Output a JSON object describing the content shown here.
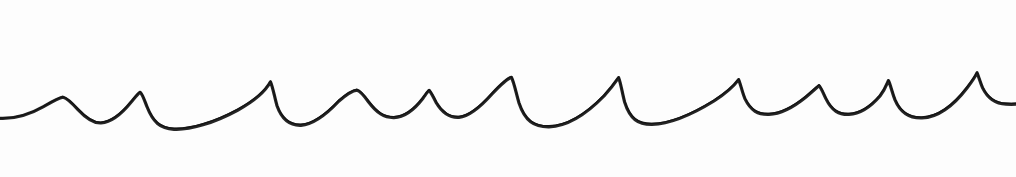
{
  "artwork": {
    "title": "Hand-drawn scalloped wave line",
    "description": "A single continuous black ink line forming a row of wave-like scallops (cusps) across a white field, drawn freehand with varying stroke weight.",
    "medium": "ink line drawing",
    "orientation": "horizontal band",
    "canvas": {
      "width": 1016,
      "height": 177,
      "background_color": "#fdfdfd"
    },
    "stroke": {
      "color": "#141414",
      "min_width": 1.4,
      "max_width": 3.2,
      "linecap": "round",
      "linejoin": "round"
    },
    "baseline_y": 110,
    "peak_count": 11,
    "trough_count": 12,
    "peaks": [
      {
        "index": 1,
        "x": 63,
        "y": 97
      },
      {
        "index": 2,
        "x": 140,
        "y": 92
      },
      {
        "index": 3,
        "x": 271,
        "y": 80
      },
      {
        "index": 4,
        "x": 357,
        "y": 90
      },
      {
        "index": 5,
        "x": 429,
        "y": 89
      },
      {
        "index": 6,
        "x": 512,
        "y": 77
      },
      {
        "index": 7,
        "x": 619,
        "y": 77
      },
      {
        "index": 8,
        "x": 739,
        "y": 79
      },
      {
        "index": 9,
        "x": 819,
        "y": 85
      },
      {
        "index": 10,
        "x": 888,
        "y": 80
      },
      {
        "index": 11,
        "x": 977,
        "y": 72
      }
    ],
    "troughs": [
      {
        "index": 1,
        "x": 10,
        "y": 119
      },
      {
        "index": 2,
        "x": 101,
        "y": 112
      },
      {
        "index": 3,
        "x": 181,
        "y": 127
      },
      {
        "index": 4,
        "x": 311,
        "y": 120
      },
      {
        "index": 5,
        "x": 395,
        "y": 112
      },
      {
        "index": 6,
        "x": 470,
        "y": 110
      },
      {
        "index": 7,
        "x": 563,
        "y": 113
      },
      {
        "index": 8,
        "x": 674,
        "y": 113
      },
      {
        "index": 9,
        "x": 781,
        "y": 103
      },
      {
        "index": 10,
        "x": 856,
        "y": 105
      },
      {
        "index": 11,
        "x": 931,
        "y": 105
      },
      {
        "index": 12,
        "x": 1014,
        "y": 103
      }
    ],
    "path_d": "M 0 118 C 14 118.6 30 114 44 106 C 53 100.8 58.5 97.6 63 96.8 C 67.5 97.8 72 102.5 78 109 C 87 118.5 94 122.6 101 122.2 C 110 121.4 121 113.8 131 101.5 C 136 95.6 138.6 92.3 140.2 91.6 C 142.2 92.8 144 98.2 147 106 C 153 121 160 127.4 174 128.2 C 190 129 214 122 238 109 C 256 99 266 89.4 270.5 81 C 272.8 86 274.4 95.8 277 105 C 282 119 290 124.6 301 124.2 C 312 123.6 325 114.8 339 100 C 348 92.4 353.6 89.6 357 89.4 C 360.4 90.2 364 94.6 368.6 101 C 377 112 384 116.8 394 116.6 C 404 116.2 414 109 423 97.4 C 426.5 92.6 428 90.2 429.2 89.6 C 431 91 433 95.8 436.4 102 C 443 113 450 117 459 116.4 C 468 115.6 479 107.6 492 93 C 502 82.4 508 77.4 511.5 76.6 C 514 81.4 516 91.6 519 102 C 525 120 534 126 549 125.8 C 566 125.4 584 115.6 604 95 C 612 86 616.6 79.6 618.6 76.8 C 620.6 81.4 622 91 624.6 101 C 630 118 638 123.6 652 123.4 C 670 123 692 113.6 714 100 C 727 91.6 734 85 738.6 78.8 C 740.6 83.2 742 90.8 745 98 C 751 110 758 113.8 769 113.4 C 780 113 793 106.6 806 96 C 813.4 89.8 817 86.4 819 84.8 C 821 86.6 823 91.8 826 98 C 832 110 839 113.8 849 113.4 C 859 113 870 106.6 880 95 C 885 88.6 887 83 888.4 79.8 C 890.4 83.4 892 91.4 895 99 C 901 113 910 117.4 922 117 C 936 116.4 952 106.6 967 87 C 973 79 976 74.2 977 72 C 978.6 75.4 980 81 982.6 87 C 988 98 995 102.8 1006 103.2 C 1010 103.4 1013 103.4 1016 103.2",
    "path_d_weight": "M 0 118.4 C 14 119 30 114.4 44 106.4 C 53 101.2 58.5 98 63 97.2 C 67.5 98.2 72 103 78 109.6 C 87 119.2 94 123.4 101 123 C 110 122.2 121 114.6 131 102.2 C 136 96.3 138.6 93 140.2 92.3 C 142.2 93.5 144 99 147 106.8 C 153 122 160 128.5 174 129.3 C 190 130.1 214 123 238 110 C 256 100 266 90.2 270.5 81.8 C 272.8 86.8 274.4 96.6 277 105.8 C 282 120 290 125.7 301 125.3 C 312 124.7 325 115.9 339 101 C 348 93.3 353.6 90.5 357 90.2 C 360.4 91 364 95.5 368.6 102 C 377 113 384 117.8 394 117.6 C 404 117.2 414 110 423 98.2 C 426.5 93.4 428 91 429.2 90.4 C 431 91.8 433 96.6 436.4 103 C 443 114 450 118 459 117.4 C 468 116.6 479 108.6 492 94 C 502 83.3 508 78.3 511.5 77.4 C 514 82.2 516 92.5 519 103 C 525 121 534 127 549 126.8 C 566 126.4 584 116.6 604 96 C 612 87 616.6 80.5 618.6 77.6 C 620.6 82.2 622 91.9 624.6 102 C 630 119 638 124.6 652 124.4 C 670 124 692 114.6 714 101 C 727 92.5 734 85.9 738.6 79.6 C 740.6 84 742 91.6 745 98.9 C 751 111 758 114.8 769 114.4 C 780 114 793 107.6 806 97 C 813.4 90.7 817 87.3 819 85.6 C 821 87.4 823 92.6 826 98.9 C 832 111 839 114.8 849 114.4 C 859 114 870 107.6 880 96 C 885 89.5 887 83.8 888.4 80.6 C 890.4 84.2 892 92.2 895 99.9 C 901 114 910 118.4 922 118 C 936 117.4 952 107.6 967 88 C 973 80 976 75 977 72.8 C 978.6 76.2 980 81.8 982.6 87.9 C 988 99 995 103.8 1006 104.2 C 1010 104.4 1013 104.4 1016 104.2"
  }
}
